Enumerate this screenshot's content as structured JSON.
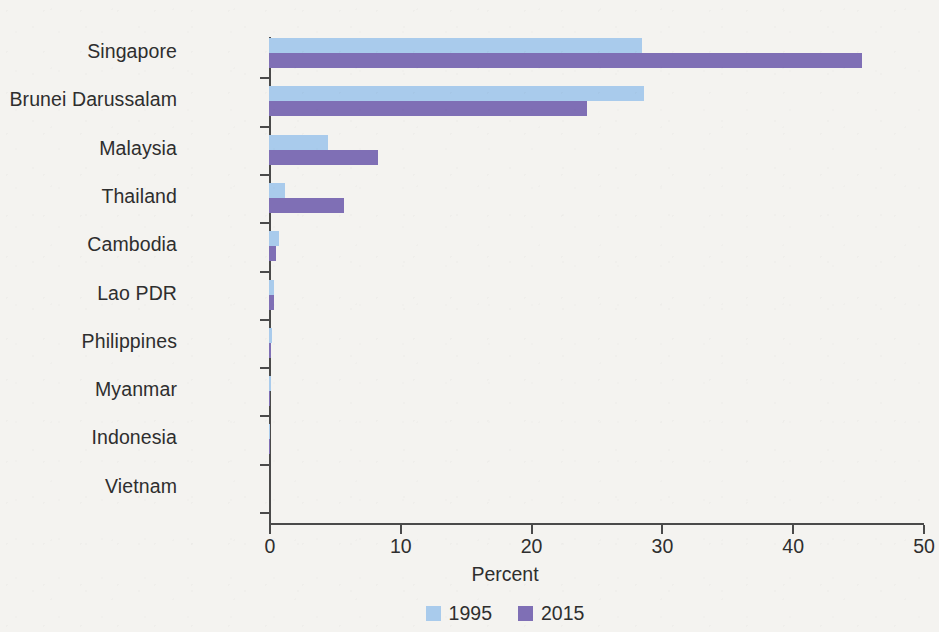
{
  "chart_data": {
    "type": "bar",
    "orientation": "horizontal",
    "title": "",
    "subtitle": "",
    "xlabel": "Percent",
    "ylabel": "",
    "xlim": [
      0,
      50
    ],
    "xticks": [
      0,
      10,
      20,
      30,
      40,
      50
    ],
    "xtick_labels": [
      "0",
      "10",
      "20",
      "30",
      "40",
      "50"
    ],
    "grid": false,
    "legend_position": "bottom-center",
    "categories": [
      "Singapore",
      "Brunei Darussalam",
      "Malaysia",
      "Thailand",
      "Cambodia",
      "Lao PDR",
      "Philippines",
      "Myanmar",
      "Indonesia",
      "Vietnam"
    ],
    "series": [
      {
        "name": "1995",
        "color": "#a9cbec",
        "values": [
          28.5,
          28.7,
          4.5,
          1.2,
          0.8,
          0.35,
          0.2,
          0.15,
          0.1,
          0.0
        ]
      },
      {
        "name": "2015",
        "color": "#7f6fb5",
        "values": [
          45.3,
          24.3,
          8.3,
          5.7,
          0.5,
          0.4,
          0.15,
          0.1,
          0.05,
          0.0
        ]
      }
    ]
  },
  "legend": {
    "items": [
      {
        "label": "1995",
        "color": "#a9cbec"
      },
      {
        "label": "2015",
        "color": "#7f6fb5"
      }
    ]
  },
  "axis": {
    "x_title": "Percent"
  },
  "colors": {
    "series_1995": "#a9cbec",
    "series_2015": "#7f6fb5",
    "axis": "#4a4a4a",
    "text": "#2e2e2e",
    "background": "#f4f3f0"
  }
}
